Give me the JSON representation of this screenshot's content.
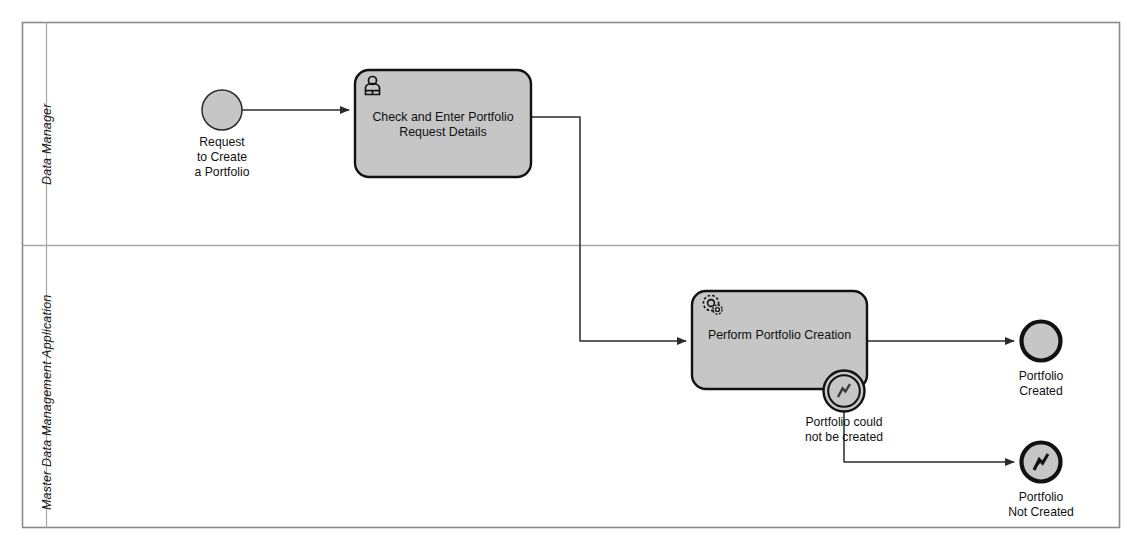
{
  "diagram": {
    "type": "bpmn-collaboration",
    "title_caption": "",
    "colors": {
      "shape_fill": "#c6c6c6",
      "shape_stroke": "#1a1a1a",
      "pool_stroke": "#8a8a8a",
      "lane_divider": "#a8a8a8",
      "flow_stroke": "#2b2b2b",
      "page_background": "#ffffff",
      "end_event_stroke": "#111111"
    },
    "pool": {
      "x": 22,
      "y": 22,
      "width": 1098,
      "height": 506,
      "lane_header_width": 24
    },
    "lanes": [
      {
        "name": "lane-data-manager",
        "label": "Data Manager",
        "y": 22,
        "height": 223
      },
      {
        "name": "lane-mdm-application",
        "label": "Master Data Management Application",
        "y": 245,
        "height": 283
      }
    ],
    "nodes": [
      {
        "id": "start-request-portfolio",
        "name": "start-event-request-to-create-a-portfolio",
        "kind": "start-event",
        "icon": "none",
        "label": "Request\nto Create\na Portfolio",
        "cx": 222,
        "cy": 110,
        "r": 20,
        "lane": "Data Manager",
        "label_x": 182,
        "label_y": 137,
        "label_w": 80
      },
      {
        "id": "task-check-enter",
        "name": "user-task-check-and-enter-portfolio-request-details",
        "kind": "task",
        "icon": "user-task-icon",
        "label": "Check and Enter Portfolio\nRequest Details",
        "x": 355,
        "y": 70,
        "width": 176,
        "height": 107,
        "lane": "Data Manager"
      },
      {
        "id": "task-perform-creation",
        "name": "service-task-perform-portfolio-creation",
        "kind": "task",
        "icon": "service-task-icon",
        "label": "Perform Portfolio Creation",
        "x": 692,
        "y": 291,
        "width": 175,
        "height": 98,
        "lane": "Master Data Management Application"
      },
      {
        "id": "boundary-error",
        "name": "boundary-error-event-portfolio-could-not-be-created",
        "kind": "boundary-error-event",
        "icon": "error-flash-icon",
        "label": "Portfolio could\nnot be created",
        "cx": 844,
        "cy": 391,
        "r": 21,
        "attached_to": "task-perform-creation",
        "label_x": 789,
        "label_y": 416,
        "label_w": 110
      },
      {
        "id": "end-portfolio-created",
        "name": "end-event-portfolio-created",
        "kind": "end-event",
        "icon": "none",
        "label": "Portfolio\nCreated",
        "cx": 1041,
        "cy": 341,
        "r": 21,
        "lane": "Master Data Management Application",
        "label_x": 996,
        "label_y": 370,
        "label_w": 90
      },
      {
        "id": "end-portfolio-not-created",
        "name": "end-event-error-portfolio-not-created",
        "kind": "end-error-event",
        "icon": "error-flash-icon",
        "label": "Portfolio\nNot Created",
        "cx": 1041,
        "cy": 462,
        "r": 21,
        "lane": "Master Data Management Application",
        "label_x": 991,
        "label_y": 491,
        "label_w": 100
      }
    ],
    "flows": [
      {
        "id": "flow-start-to-check",
        "name": "sequence-flow-start-to-check-and-enter",
        "from": "start-request-portfolio",
        "to": "task-check-enter",
        "points": "242,110 355,110"
      },
      {
        "id": "flow-check-to-perform",
        "name": "sequence-flow-check-and-enter-to-perform-creation",
        "from": "task-check-enter",
        "to": "task-perform-creation",
        "points": "531,117 580,117 580,341 692,341"
      },
      {
        "id": "flow-perform-to-created",
        "name": "sequence-flow-perform-creation-to-portfolio-created",
        "from": "task-perform-creation",
        "to": "end-portfolio-created",
        "points": "867,341 1020,341"
      },
      {
        "id": "flow-error-to-not-created",
        "name": "sequence-flow-boundary-error-to-portfolio-not-created",
        "from": "boundary-error",
        "to": "end-portfolio-not-created",
        "points": "844,412 844,462 1020,462"
      }
    ]
  }
}
